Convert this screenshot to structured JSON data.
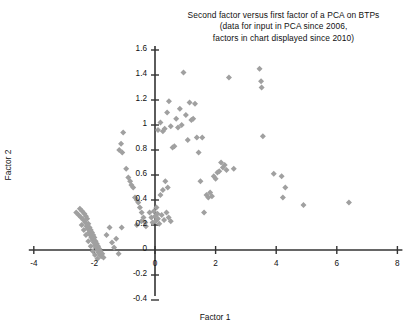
{
  "chart_data": {
    "type": "scatter",
    "title": "Second factor versus first factor of a PCA on BTPs (data for input in PCA since 2006, factors in chart displayed since 2010)",
    "title_lines": [
      "Second factor versus first factor of a PCA on BTPs",
      "(data for input in PCA since 2006,",
      "factors in chart displayed since 2010)"
    ],
    "xlabel": "Factor 1",
    "ylabel": "Factor 2",
    "xlim": [
      -4,
      8
    ],
    "ylim": [
      -0.4,
      1.6
    ],
    "xticks": [
      -4,
      -2,
      0,
      2,
      4,
      6,
      8
    ],
    "xtick_labels": [
      "-4",
      "-2",
      "0",
      "2",
      "4",
      "6",
      "8"
    ],
    "yticks": [
      -0.4,
      -0.2,
      0,
      0.2,
      0.4,
      0.6,
      0.8,
      1,
      1.2,
      1.4,
      1.6
    ],
    "ytick_labels": [
      "-0.4",
      "-0.2",
      "0",
      "0.2",
      "0.4",
      "0.6",
      "0.8",
      "1",
      "1.2",
      "1.4",
      "1.6"
    ],
    "grid": false,
    "legend": null,
    "marker": "diamond",
    "marker_color": "#a0a0a0",
    "axis_color": "#333333",
    "series": [
      {
        "name": "BTP observations",
        "points": [
          [
            -2.6,
            0.3
          ],
          [
            -2.52,
            0.28
          ],
          [
            -2.48,
            0.33
          ],
          [
            -2.44,
            0.26
          ],
          [
            -2.4,
            0.31
          ],
          [
            -2.36,
            0.24
          ],
          [
            -2.33,
            0.29
          ],
          [
            -2.3,
            0.22
          ],
          [
            -2.28,
            0.27
          ],
          [
            -2.26,
            0.19
          ],
          [
            -2.24,
            0.25
          ],
          [
            -2.22,
            0.17
          ],
          [
            -2.2,
            0.21
          ],
          [
            -2.18,
            0.14
          ],
          [
            -2.16,
            0.18
          ],
          [
            -2.14,
            0.12
          ],
          [
            -2.12,
            0.16
          ],
          [
            -2.1,
            0.1
          ],
          [
            -2.08,
            0.14
          ],
          [
            -2.06,
            0.08
          ],
          [
            -2.04,
            0.12
          ],
          [
            -2.02,
            0.06
          ],
          [
            -2.0,
            0.1
          ],
          [
            -1.98,
            0.04
          ],
          [
            -1.96,
            0.07
          ],
          [
            -1.94,
            0.02
          ],
          [
            -1.92,
            0.05
          ],
          [
            -1.9,
            0.0
          ],
          [
            -1.88,
            0.03
          ],
          [
            -1.86,
            -0.02
          ],
          [
            -1.84,
            0.01
          ],
          [
            -1.82,
            -0.04
          ],
          [
            -1.8,
            -0.01
          ],
          [
            -1.78,
            -0.05
          ],
          [
            -1.74,
            -0.03
          ],
          [
            -1.7,
            -0.06
          ],
          [
            -2.42,
            0.2
          ],
          [
            -2.35,
            0.16
          ],
          [
            -2.28,
            0.12
          ],
          [
            -2.2,
            0.07
          ],
          [
            -2.12,
            0.03
          ],
          [
            -2.05,
            -0.01
          ],
          [
            -1.98,
            -0.04
          ],
          [
            -1.9,
            -0.07
          ],
          [
            -1.6,
            0.12
          ],
          [
            -1.5,
            0.18
          ],
          [
            -1.42,
            0.06
          ],
          [
            -1.35,
            0.02
          ],
          [
            -1.28,
            0.09
          ],
          [
            -1.2,
            -0.03
          ],
          [
            -1.1,
            0.18
          ],
          [
            -1.05,
            0.94
          ],
          [
            -1.12,
            0.85
          ],
          [
            -1.18,
            0.8
          ],
          [
            -1.08,
            0.78
          ],
          [
            -0.95,
            0.65
          ],
          [
            -0.88,
            0.58
          ],
          [
            -0.82,
            0.55
          ],
          [
            -0.78,
            0.52
          ],
          [
            -0.72,
            0.5
          ],
          [
            -0.66,
            0.42
          ],
          [
            -0.6,
            0.4
          ],
          [
            -0.55,
            0.38
          ],
          [
            -0.5,
            0.34
          ],
          [
            -0.44,
            0.3
          ],
          [
            -0.38,
            0.26
          ],
          [
            -0.32,
            0.22
          ],
          [
            -0.6,
            0.2
          ],
          [
            -0.45,
            0.23
          ],
          [
            -0.3,
            0.19
          ],
          [
            -0.18,
            0.3
          ],
          [
            -0.12,
            0.26
          ],
          [
            -0.08,
            0.22
          ],
          [
            -0.04,
            0.31
          ],
          [
            0.0,
            0.27
          ],
          [
            0.02,
            0.23
          ],
          [
            0.05,
            0.34
          ],
          [
            0.08,
            0.29
          ],
          [
            0.1,
            0.25
          ],
          [
            0.14,
            0.21
          ],
          [
            0.22,
            0.28
          ],
          [
            0.3,
            0.24
          ],
          [
            0.38,
            0.3
          ],
          [
            0.45,
            0.26
          ],
          [
            0.52,
            0.23
          ],
          [
            0.18,
            0.44
          ],
          [
            0.26,
            0.48
          ],
          [
            0.34,
            0.55
          ],
          [
            0.42,
            0.5
          ],
          [
            0.1,
            0.96
          ],
          [
            0.18,
            1.02
          ],
          [
            0.26,
            0.95
          ],
          [
            0.32,
            0.97
          ],
          [
            0.4,
            1.1
          ],
          [
            0.46,
            1.19
          ],
          [
            0.52,
            0.99
          ],
          [
            0.58,
            0.82
          ],
          [
            0.64,
            0.83
          ],
          [
            0.7,
            1.05
          ],
          [
            0.76,
            0.98
          ],
          [
            0.82,
            1.13
          ],
          [
            0.88,
            1.0
          ],
          [
            0.94,
            1.42
          ],
          [
            1.02,
            1.08
          ],
          [
            1.08,
            0.88
          ],
          [
            1.14,
            1.18
          ],
          [
            1.2,
            1.04
          ],
          [
            1.26,
            1.05
          ],
          [
            1.32,
            1.17
          ],
          [
            1.38,
            0.9
          ],
          [
            1.44,
            0.78
          ],
          [
            1.5,
            0.55
          ],
          [
            1.56,
            0.9
          ],
          [
            1.62,
            0.3
          ],
          [
            1.7,
            0.44
          ],
          [
            1.76,
            0.42
          ],
          [
            1.82,
            0.46
          ],
          [
            1.88,
            0.43
          ],
          [
            1.94,
            0.59
          ],
          [
            2.0,
            0.57
          ],
          [
            2.06,
            0.62
          ],
          [
            2.12,
            0.63
          ],
          [
            2.18,
            0.7
          ],
          [
            2.24,
            0.66
          ],
          [
            2.3,
            0.68
          ],
          [
            2.36,
            0.64
          ],
          [
            2.44,
            1.38
          ],
          [
            2.6,
            0.65
          ],
          [
            3.45,
            1.45
          ],
          [
            3.5,
            1.35
          ],
          [
            3.52,
            1.3
          ],
          [
            3.56,
            0.91
          ],
          [
            3.92,
            0.61
          ],
          [
            4.18,
            0.59
          ],
          [
            4.3,
            0.5
          ],
          [
            4.22,
            0.42
          ],
          [
            4.9,
            0.36
          ],
          [
            6.4,
            0.38
          ]
        ]
      }
    ]
  },
  "axes": {
    "x_axis_name": "x-axis",
    "y_axis_name": "y-axis"
  }
}
